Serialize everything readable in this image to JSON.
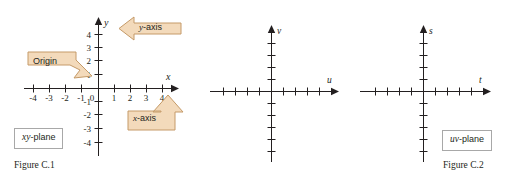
{
  "page": {
    "background": "#ffffff",
    "ink": "#231f20",
    "callout_fill": "#f3dabb",
    "callout_stroke": "#c59a68",
    "box_stroke": "#a8a8a8"
  },
  "figures": [
    {
      "id": "figure-1",
      "caption": "Figure C.1",
      "plane_box": {
        "var": "xy",
        "suffix": "-plane"
      },
      "axes": {
        "horizontal_label": "x",
        "vertical_label": "y",
        "x_ticks": [
          "-4",
          "-3",
          "-2",
          "-1",
          "0",
          "1",
          "2",
          "3",
          "4"
        ],
        "y_ticks": [
          "4",
          "3",
          "2",
          "1",
          "-1",
          "-2",
          "-3",
          "-4"
        ],
        "origin_label": "0"
      },
      "callouts": [
        {
          "name": "origin",
          "text": "Origin",
          "direction": "down-right"
        },
        {
          "name": "y-axis",
          "text": "y-axis",
          "italic_prefix": "y",
          "rest": "-axis",
          "direction": "left"
        },
        {
          "name": "x-axis",
          "text": "x-axis",
          "italic_prefix": "x",
          "rest": "-axis",
          "direction": "up"
        }
      ]
    },
    {
      "id": "figure-2",
      "caption": "Figure C.2",
      "plane_box": {
        "var": "uv",
        "suffix": "-plane"
      },
      "axes": {
        "horizontal_label": "u",
        "vertical_label": "v",
        "x_ticks": [],
        "y_ticks": []
      },
      "callouts": []
    },
    {
      "id": "figure-3",
      "caption": "",
      "plane_box": {
        "var": "ts",
        "suffix": "-plane"
      },
      "axes": {
        "horizontal_label": "t",
        "vertical_label": "s",
        "x_ticks": [],
        "y_ticks": []
      },
      "callouts": []
    }
  ]
}
